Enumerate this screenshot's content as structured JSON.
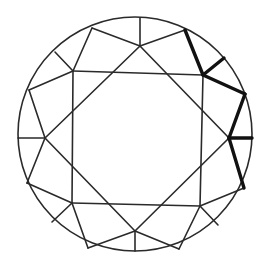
{
  "diagram": {
    "colors": {
      "background": "#ffffff",
      "line": "#2a2a2a",
      "highlight": "#111111"
    },
    "girdle": {
      "cx": 135,
      "cy": 134,
      "r": 117
    },
    "thin_lines": [
      [
        73,
        71,
        203,
        75
      ],
      [
        203,
        75,
        200,
        206
      ],
      [
        200,
        206,
        72,
        203
      ],
      [
        72,
        203,
        73,
        71
      ],
      [
        140,
        46,
        229,
        138
      ],
      [
        229,
        138,
        135,
        231
      ],
      [
        135,
        231,
        45,
        138
      ],
      [
        45,
        138,
        140,
        46
      ],
      [
        140,
        46,
        140,
        18
      ],
      [
        140,
        46,
        92,
        28
      ],
      [
        140,
        46,
        185,
        30
      ],
      [
        73,
        71,
        92,
        28
      ],
      [
        73,
        71,
        55,
        52
      ],
      [
        73,
        71,
        29,
        90
      ],
      [
        45,
        138,
        29,
        90
      ],
      [
        45,
        138,
        18,
        138
      ],
      [
        45,
        138,
        27,
        183
      ],
      [
        72,
        203,
        27,
        183
      ],
      [
        72,
        203,
        52,
        222
      ],
      [
        72,
        203,
        88,
        248
      ],
      [
        135,
        231,
        88,
        248
      ],
      [
        135,
        231,
        135,
        251
      ],
      [
        135,
        231,
        179,
        249
      ],
      [
        200,
        206,
        179,
        249
      ],
      [
        200,
        206,
        218,
        225
      ],
      [
        200,
        206,
        244,
        188
      ]
    ],
    "bold_lines": [
      [
        185,
        30,
        203,
        75
      ],
      [
        203,
        75,
        224,
        58
      ],
      [
        203,
        75,
        245,
        94
      ],
      [
        245,
        94,
        229,
        138
      ],
      [
        229,
        138,
        252,
        138
      ],
      [
        229,
        138,
        244,
        188
      ],
      [
        203,
        75,
        160,
        74
      ],
      [
        203,
        75,
        229,
        138
      ],
      [
        200,
        140,
        229,
        138
      ],
      [
        229,
        138,
        200,
        160
      ]
    ]
  }
}
